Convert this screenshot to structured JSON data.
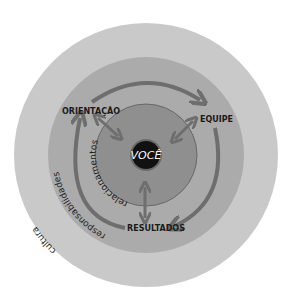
{
  "diagram": {
    "center": {
      "label": "VOCÊ"
    },
    "rings": [
      {
        "name": "cultura",
        "label": "cultura",
        "color": "#c9c9c9"
      },
      {
        "name": "responsabilidades",
        "label": "responsabilidades",
        "color": "#ababab"
      },
      {
        "name": "relacionamentos",
        "label": "relacionamentos",
        "color": "#8f8f8f"
      }
    ],
    "core_color": "#111111",
    "arrow_color": "#6e6e6e",
    "nodes": [
      {
        "label": "ORIENTAÇÃO"
      },
      {
        "label": "EQUIPE"
      },
      {
        "label": "RESULTADOS"
      }
    ]
  }
}
